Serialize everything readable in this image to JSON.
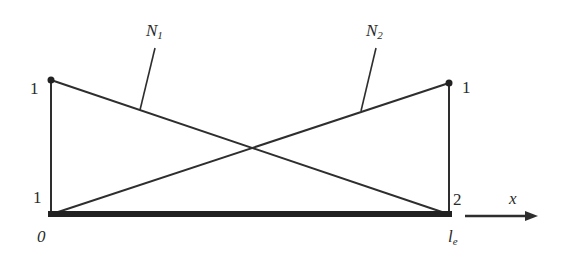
{
  "diagram": {
    "curves": [
      {
        "name": "N",
        "subscript": "1",
        "description": "descends from 1 at node 1 to 0 at node 2"
      },
      {
        "name": "N",
        "subscript": "2",
        "description": "rises from 0 at node 1 to 1 at node 2"
      }
    ],
    "left_node": {
      "top_value": "1",
      "node_number": "1",
      "coord": "0"
    },
    "right_node": {
      "top_value": "1",
      "node_number": "2",
      "coord_base": "l",
      "coord_sub": "e"
    },
    "axis_label": "x",
    "colors": {
      "line": "#2e2e2e",
      "bar": "#222222",
      "background": "#ffffff"
    }
  }
}
